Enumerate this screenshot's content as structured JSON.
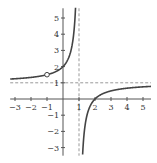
{
  "chart_data": {
    "type": "line",
    "title": "",
    "xlabel": "",
    "ylabel": "",
    "xlim": [
      -3.3,
      5.5
    ],
    "ylim": [
      -3.5,
      5.6
    ],
    "x_ticks": [
      -3,
      -2,
      -1,
      1,
      2,
      3,
      4,
      5
    ],
    "x_tick_labels": [
      "−3",
      "−2",
      "−1",
      "1",
      "2",
      "3",
      "4",
      "5"
    ],
    "y_ticks": [
      5,
      4,
      3,
      2,
      1,
      -1,
      -2,
      -3
    ],
    "y_tick_labels": [
      "5",
      "4",
      "3",
      "2",
      "1",
      "−1",
      "−2",
      "−3"
    ],
    "grid": false,
    "function": "f(x) = (x - 2)/(x - 1)",
    "vertical_asymptote": 1,
    "horizontal_asymptote": 1,
    "hole": {
      "x": -1,
      "y": 1.5
    },
    "key_points": [
      {
        "x": 0,
        "y": 2
      },
      {
        "x": 2,
        "y": 0
      }
    ],
    "series": [
      {
        "name": "left-branch",
        "x": [
          -3.3,
          -3,
          -2,
          -1,
          0,
          0.5,
          0.7,
          0.8
        ],
        "y": [
          1.23,
          1.25,
          1.33,
          1.5,
          2,
          3,
          4.33,
          6
        ]
      },
      {
        "name": "right-branch",
        "x": [
          1.22,
          1.3,
          1.5,
          2,
          3,
          4,
          5,
          5.5
        ],
        "y": [
          -3.5,
          -2.33,
          -1,
          0,
          0.5,
          0.67,
          0.75,
          0.78
        ]
      }
    ],
    "colors": {
      "curve": "#444444",
      "axes": "#555555",
      "asymptote": "#999999"
    }
  }
}
